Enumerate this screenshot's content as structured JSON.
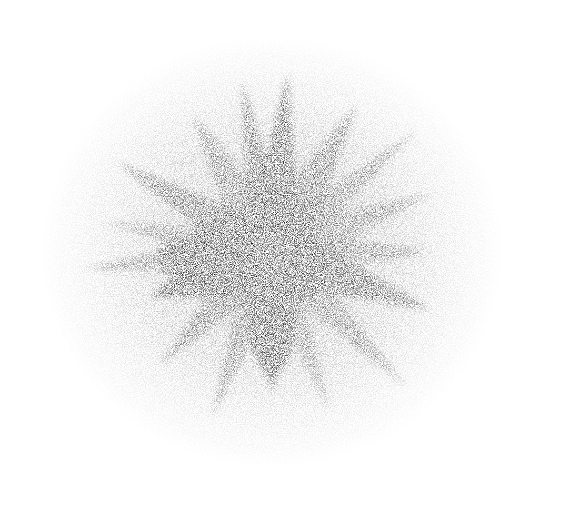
{
  "image": {
    "subject": "grayscale stippled starburst splatter",
    "background_color": "#ffffff",
    "ink_color": "#111111",
    "center": [
      272,
      252
    ],
    "spikes": [
      {
        "angle": -150,
        "length": 180,
        "width": 22,
        "opacity": 0.75
      },
      {
        "angle": -120,
        "length": 160,
        "width": 26,
        "opacity": 0.6
      },
      {
        "angle": -100,
        "length": 175,
        "width": 18,
        "opacity": 0.8
      },
      {
        "angle": -85,
        "length": 180,
        "width": 24,
        "opacity": 0.85
      },
      {
        "angle": -60,
        "length": 170,
        "width": 26,
        "opacity": 0.7
      },
      {
        "angle": -40,
        "length": 190,
        "width": 18,
        "opacity": 0.55
      },
      {
        "angle": -20,
        "length": 170,
        "width": 22,
        "opacity": 0.55
      },
      {
        "angle": 0,
        "length": 160,
        "width": 20,
        "opacity": 0.6
      },
      {
        "angle": 20,
        "length": 170,
        "width": 26,
        "opacity": 0.8
      },
      {
        "angle": 45,
        "length": 190,
        "width": 20,
        "opacity": 0.55
      },
      {
        "angle": 70,
        "length": 170,
        "width": 18,
        "opacity": 0.5
      },
      {
        "angle": 90,
        "length": 140,
        "width": 36,
        "opacity": 0.9
      },
      {
        "angle": 110,
        "length": 175,
        "width": 20,
        "opacity": 0.6
      },
      {
        "angle": 135,
        "length": 160,
        "width": 22,
        "opacity": 0.65
      },
      {
        "angle": 160,
        "length": 130,
        "width": 38,
        "opacity": 0.95
      },
      {
        "angle": 175,
        "length": 190,
        "width": 20,
        "opacity": 0.55
      },
      {
        "angle": -170,
        "length": 170,
        "width": 18,
        "opacity": 0.5
      }
    ]
  }
}
